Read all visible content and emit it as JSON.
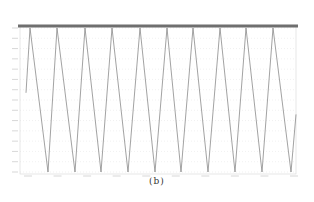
{
  "figure": {
    "caption": "(b)",
    "colors": {
      "header_bar": "#6f6f6f",
      "line": "#8a8a8a",
      "grid": "#e2e2e2",
      "axis": "#bdbdbd"
    }
  },
  "chart_data": {
    "type": "line",
    "title": "",
    "xlabel": "",
    "ylabel": "",
    "x_ticks_count": 10,
    "y_ticks_count": 14,
    "tick_labels_legible": false,
    "grid": true,
    "legend": null,
    "normalized_range": [
      -1,
      1
    ],
    "period_units": 1,
    "x": [
      0,
      0.07,
      0.64,
      1.07,
      1.64,
      2.07,
      2.64,
      3.07,
      3.64,
      4.07,
      4.64,
      5.07,
      5.64,
      6.07,
      6.64,
      7.07,
      7.64,
      8.07,
      8.64,
      9.07,
      9.64,
      10.07,
      10.64,
      10.85
    ],
    "y": [
      0.1,
      1,
      -1,
      1,
      -1,
      1,
      -1,
      1,
      -1,
      1,
      -1,
      1,
      -1,
      1,
      -1,
      1,
      -1,
      1,
      -1,
      1,
      -1,
      1,
      -1,
      -0.2
    ],
    "peaks_px_x": [
      30,
      57,
      85,
      112,
      140,
      167,
      193,
      220,
      246,
      273
    ],
    "troughs_px_x": [
      48,
      75,
      101,
      128,
      155,
      181,
      208,
      235,
      262,
      291
    ]
  }
}
